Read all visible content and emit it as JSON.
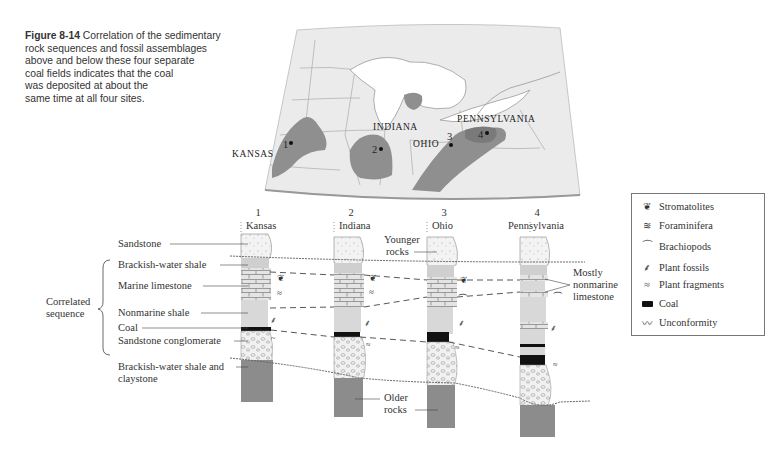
{
  "figure": {
    "number": "Figure 8-14",
    "caption": "Correlation of the sedimentary rock sequences and fossil assemblages above and below these four separate coal fields indicates that the coal was deposited at about the same time at all four sites.",
    "caption_lines": [
      "Correlation of the sedimentary",
      "rock sequences and fossil assemblages",
      "above and below these four separate",
      "coal fields indicates that the coal",
      "was deposited at about the",
      "same time at all four sites."
    ]
  },
  "map": {
    "state_labels": [
      "KANSAS",
      "INDIANA",
      "OHIO",
      "PENNSYLVANIA"
    ],
    "site_markers": [
      {
        "number": "1",
        "state": "KANSAS"
      },
      {
        "number": "2",
        "state": "INDIANA"
      },
      {
        "number": "3",
        "state": "OHIO"
      },
      {
        "number": "4",
        "state": "PENNSYLVANIA"
      }
    ]
  },
  "columns": [
    {
      "number": "1",
      "name": "Kansas"
    },
    {
      "number": "2",
      "name": "Indiana"
    },
    {
      "number": "3",
      "name": "Ohio"
    },
    {
      "number": "4",
      "name": "Pennsylvania"
    }
  ],
  "left_labels": {
    "sandstone": "Sandstone",
    "brackish_shale": "Brackish-water shale",
    "marine_limestone": "Marine limestone",
    "nonmarine_shale": "Nonmarine shale",
    "coal": "Coal",
    "sandstone_conglomerate": "Sandstone conglomerate",
    "brackish_claystone_1": "Brackish-water shale and",
    "brackish_claystone_2": "claystone",
    "correlated_1": "Correlated",
    "correlated_2": "sequence"
  },
  "annotations": {
    "younger_1": "Younger",
    "younger_2": "rocks",
    "older_1": "Older",
    "older_2": "rocks",
    "nonmarine_1": "Mostly",
    "nonmarine_2": "nonmarine",
    "nonmarine_3": "limestone"
  },
  "legend": {
    "items": [
      {
        "icon": "stromatolite-icon",
        "label": "Stromatolites"
      },
      {
        "icon": "foraminifera-icon",
        "label": "Foraminifera"
      },
      {
        "icon": "brachiopod-icon",
        "label": "Brachiopods"
      },
      {
        "icon": "plant-fossil-icon",
        "label": "Plant fossils"
      },
      {
        "icon": "plant-fragment-icon",
        "label": "Plant fragments"
      },
      {
        "icon": "coal-icon",
        "label": "Coal"
      },
      {
        "icon": "unconformity-icon",
        "label": "Unconformity"
      }
    ]
  },
  "colors": {
    "map_land": "#e6e6e6",
    "coal_field": "#8f8f8f",
    "older_rock": "#8c8c8c",
    "shale": "#cfcfcf",
    "coal": "#111111",
    "sandstone": "#f2f2f2"
  }
}
